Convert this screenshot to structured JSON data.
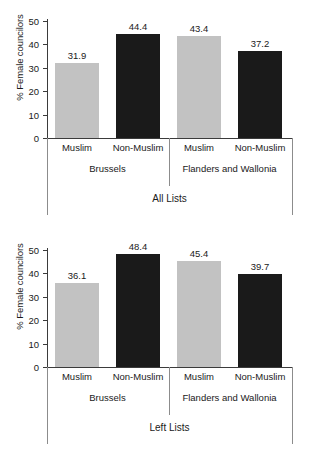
{
  "figure": {
    "background": "#ffffff",
    "light_bar_color": "#c2c2c2",
    "dark_bar_color": "#1a1a1a",
    "axis_color": "#3b3b3b"
  },
  "chart_data": [
    {
      "type": "bar",
      "title": "All Lists",
      "ylabel": "% Female councilors",
      "xlabel": "",
      "ylim": [
        0,
        50
      ],
      "yticks": [
        0,
        10,
        20,
        30,
        40,
        50
      ],
      "ytick_labels": [
        "0",
        "10",
        "20",
        "30",
        "40",
        "50"
      ],
      "grid": false,
      "legend": "none",
      "categories": [
        "Muslim",
        "Non-Muslim",
        "Muslim",
        "Non-Muslim"
      ],
      "groups": [
        "Brussels",
        "Flanders and Wallonia"
      ],
      "values": [
        31.9,
        44.4,
        43.4,
        37.2
      ],
      "value_labels": [
        "31.9",
        "44.4",
        "43.4",
        "37.2"
      ],
      "bar_colors": [
        "#c2c2c2",
        "#1a1a1a",
        "#c2c2c2",
        "#1a1a1a"
      ],
      "series": [
        {
          "name": "Muslim",
          "values": [
            31.9,
            43.4
          ]
        },
        {
          "name": "Non-Muslim",
          "values": [
            44.4,
            37.2
          ]
        }
      ]
    },
    {
      "type": "bar",
      "title": "Left Lists",
      "ylabel": "% Female councilors",
      "xlabel": "",
      "ylim": [
        0,
        50
      ],
      "yticks": [
        0,
        10,
        20,
        30,
        40,
        50
      ],
      "ytick_labels": [
        "0",
        "10",
        "20",
        "30",
        "40",
        "50"
      ],
      "grid": false,
      "legend": "none",
      "categories": [
        "Muslim",
        "Non-Muslim",
        "Muslim",
        "Non-Muslim"
      ],
      "groups": [
        "Brussels",
        "Flanders and Wallonia"
      ],
      "values": [
        36.1,
        48.4,
        45.4,
        39.7
      ],
      "value_labels": [
        "36.1",
        "48.4",
        "45.4",
        "39.7"
      ],
      "bar_colors": [
        "#c2c2c2",
        "#1a1a1a",
        "#c2c2c2",
        "#1a1a1a"
      ],
      "series": [
        {
          "name": "Muslim",
          "values": [
            36.1,
            45.4
          ]
        },
        {
          "name": "Non-Muslim",
          "values": [
            48.4,
            39.7
          ]
        }
      ]
    }
  ]
}
